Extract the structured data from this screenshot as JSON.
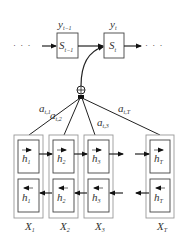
{
  "diagram": {
    "type": "attention-bilstm-encoder-decoder",
    "decoder": {
      "ellipsis_left": "· · ·",
      "ellipsis_right": "· · ·",
      "states": [
        {
          "label": "S",
          "sub": "t−1",
          "output_label": "y",
          "output_sub": "t−1"
        },
        {
          "label": "S",
          "sub": "t",
          "output_label": "y",
          "output_sub": "t"
        }
      ]
    },
    "combiner": {
      "symbol": "⊕"
    },
    "attention_weights": [
      {
        "label": "a",
        "sub": "t,1"
      },
      {
        "label": "a",
        "sub": "t,2"
      },
      {
        "label": "a",
        "sub": "t,3"
      },
      {
        "label": "a",
        "sub": "t,T"
      }
    ],
    "encoder": {
      "columns": [
        {
          "input": "X",
          "input_sub": "1",
          "forward": "h",
          "forward_sub": "1",
          "backward": "h",
          "backward_sub": "1"
        },
        {
          "input": "X",
          "input_sub": "2",
          "forward": "h",
          "forward_sub": "2",
          "backward": "h",
          "backward_sub": "2"
        },
        {
          "input": "X",
          "input_sub": "3",
          "forward": "h",
          "forward_sub": "3",
          "backward": "h",
          "backward_sub": "3"
        },
        {
          "input": "X",
          "input_sub": "T",
          "forward": "h",
          "forward_sub": "T",
          "backward": "h",
          "backward_sub": "T"
        }
      ]
    },
    "colors": {
      "line": "#222222",
      "outer_box": "#999999",
      "inner_box": "#444444",
      "background": "#ffffff"
    }
  }
}
